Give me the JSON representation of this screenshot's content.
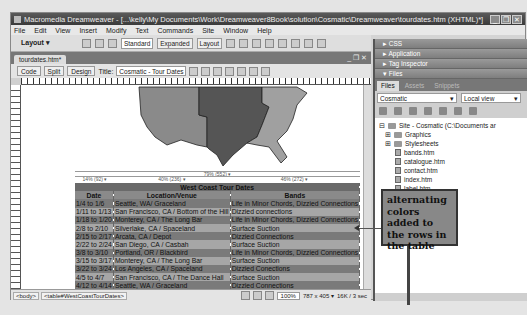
{
  "window": {
    "title": "Macromedia Dreamweaver - [...\\kelly\\My Documents\\Work\\Dreamweaver8Book\\solution\\Cosmatic\\Dreamweaver\\tourdates.htm (XHTML)*]",
    "controls": [
      "_",
      "❐",
      "✕"
    ]
  },
  "menubar": [
    "File",
    "Edit",
    "View",
    "Insert",
    "Modify",
    "Text",
    "Commands",
    "Site",
    "Window",
    "Help"
  ],
  "toolbar": {
    "layout_label": "Layout ▾",
    "modes": [
      "Standard",
      "Expanded",
      "Layout"
    ],
    "active_mode": "Standard"
  },
  "document": {
    "tab_label": "tourdates.htm*",
    "window_controls": "_ ❐ ✕",
    "view_buttons": [
      "Code",
      "Split",
      "Design"
    ],
    "title_label": "Title:",
    "title_value": "Cosmatic - Tour Dates",
    "width_guides": {
      "overall": "79% (552) ▾",
      "col1": "14% (92) ▾",
      "col2": "40% (236) ▾",
      "col3": "46% (272) ▾"
    },
    "table": {
      "caption": "West Coast Tour Dates",
      "headers": [
        "Date",
        "Location/Venue",
        "Bands"
      ],
      "rows": [
        [
          "1/4 to 1/6",
          "Seattle, WA/ Graceland",
          "Life in Minor Chords, Dizzied Connections"
        ],
        [
          "1/11 to 1/13",
          "San Francisco, CA / Bottom of the Hill",
          "Dizzied connections"
        ],
        [
          "1/18 to 1/20",
          "Monterey, CA / The Long Bar",
          "Life in Minor Chords, Dizzied Connections"
        ],
        [
          "2/8 to 2/10",
          "Silverlake, CA / Spaceland",
          "Surface Suction"
        ],
        [
          "2/15 to 2/17",
          "Arcata, CA / Depot",
          "Dizzied Connections"
        ],
        [
          "2/22 to 2/24",
          "San Diego, CA / Casbah",
          "Surface Suction"
        ],
        [
          "3/8 to 3/10",
          "Portland, OR / Blackbird",
          "Life in Minor Chords, Dizzied Connections"
        ],
        [
          "3/15 to 3/17",
          "Monterey, CA / The Long Bar",
          "Surface Suction"
        ],
        [
          "3/22 to 3/24",
          "Los Angeles, CA / Spaceland",
          "Dizzied Conections"
        ],
        [
          "4/5 to 4/7",
          "San Francisco, CA / The Dance Hall",
          "Surface Suction"
        ],
        [
          "4/12 to 4/14",
          "Seattle, WA / Graceland",
          "Dizzied Connections"
        ]
      ]
    }
  },
  "statusbar": {
    "tags": [
      "<body>",
      "<table#WestCoastTourDates>"
    ],
    "zoom": "100%",
    "dimensions": "787 x 405 ▾",
    "download": "16K / 3 sec"
  },
  "panels": {
    "groups": [
      "▸ CSS",
      "▸ Application",
      "▸ Tag Inspector",
      "▾ Files"
    ],
    "files_tabs": [
      "Files",
      "Assets",
      "Snippets"
    ],
    "site_select": "Cosmatic",
    "view_select": "Local view",
    "tree": [
      {
        "label": "Site - Cosmatic (C:\\Documents ar",
        "type": "site",
        "indent": 0
      },
      {
        "label": "Graphics",
        "type": "folder",
        "indent": 1
      },
      {
        "label": "Stylesheets",
        "type": "folder",
        "indent": 1
      },
      {
        "label": "bands.htm",
        "type": "file",
        "indent": 2
      },
      {
        "label": "catalogue.htm",
        "type": "file",
        "indent": 2
      },
      {
        "label": "contact.htm",
        "type": "file",
        "indent": 2
      },
      {
        "label": "index.htm",
        "type": "file",
        "indent": 2
      },
      {
        "label": "label.htm",
        "type": "file",
        "indent": 2
      },
      {
        "label": "tourdates.htm",
        "type": "file",
        "indent": 2
      }
    ]
  },
  "callout": {
    "text": "alternating colors added to the rows in the table"
  }
}
